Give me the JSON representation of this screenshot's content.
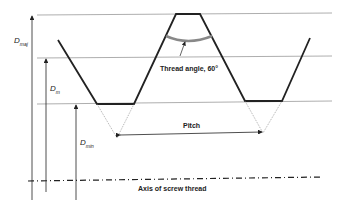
{
  "diagram": {
    "labels": {
      "d_major": {
        "main": "D",
        "sub": "maj"
      },
      "d_mean": {
        "main": "D",
        "sub": "m"
      },
      "d_minor": {
        "main": "D",
        "sub": "min"
      },
      "thread_angle": "Thread angle, 60°",
      "pitch": "Pitch",
      "axis": "Axis of screw thread"
    },
    "colors": {
      "line": "#222222",
      "guide": "#999999",
      "angle_arc": "#888888"
    }
  }
}
